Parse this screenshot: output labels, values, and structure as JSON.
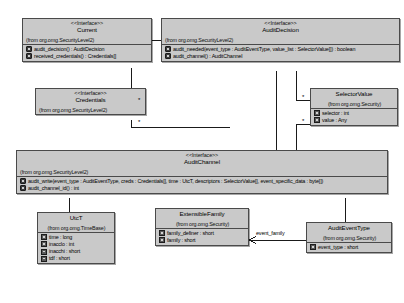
{
  "diagram": {
    "classes": [
      {
        "id": "current",
        "stereotype": "<<Interface>>",
        "name": "Current",
        "package": "(from org.omg.SecurityLevel2)",
        "members": [
          {
            "kind": "method",
            "text": "audit_decision() : AuditDecision"
          },
          {
            "kind": "method",
            "text": "received_credentials() : Credentials[]"
          }
        ]
      },
      {
        "id": "auditdecision",
        "stereotype": "<<Interface>>",
        "name": "AuditDecision",
        "package": "(from org.omg.SecurityLevel2)",
        "members": [
          {
            "kind": "method",
            "text": "audit_needed(event_type : AuditEventType, value_list : SelectorValue[]) : boolean"
          },
          {
            "kind": "method",
            "text": "audit_channel() : AuditChannel"
          }
        ]
      },
      {
        "id": "credentials",
        "stereotype": "<<Interface>>",
        "name": "Credentials",
        "package": "(from org.omg.SecurityLevel2)",
        "members": []
      },
      {
        "id": "selectorvalue",
        "stereotype": "",
        "name": "SelectorValue",
        "package": "(from org.omg.Security)",
        "members": [
          {
            "kind": "attribute",
            "text": "selector : int"
          },
          {
            "kind": "attribute",
            "text": "value : Any"
          }
        ]
      },
      {
        "id": "auditchannel",
        "stereotype": "<<Interface>>",
        "name": "AuditChannel",
        "package": "(from org.omg.SecurityLevel2)",
        "members": [
          {
            "kind": "method",
            "text": "audit_write(event_type : AuditEventType, creds : Credentials[], time : UtcT, descriptors : SelectorValue[], event_specific_data : byte[])"
          },
          {
            "kind": "method",
            "text": "audit_channel_id() : int"
          }
        ]
      },
      {
        "id": "utct",
        "stereotype": "",
        "name": "UtcT",
        "package": "(from org.omg.TimeBase)",
        "members": [
          {
            "kind": "attribute",
            "text": "time : long"
          },
          {
            "kind": "attribute",
            "text": "inacclo : int"
          },
          {
            "kind": "attribute",
            "text": "inacchi : short"
          },
          {
            "kind": "attribute",
            "text": "tdf : short"
          }
        ]
      },
      {
        "id": "extensiblefamily",
        "stereotype": "",
        "name": "ExtensibleFamily",
        "package": "(from org.omg.Security)",
        "members": [
          {
            "kind": "attribute",
            "text": "family_definer : short"
          },
          {
            "kind": "attribute",
            "text": "family : short"
          }
        ]
      },
      {
        "id": "auditeventtype",
        "stereotype": "",
        "name": "AuditEventType",
        "package": "(from org.omg.Security)",
        "members": [
          {
            "kind": "attribute",
            "text": "event_type : short"
          }
        ]
      }
    ],
    "multiplicities": [
      {
        "id": "m1",
        "text": "*"
      },
      {
        "id": "m2",
        "text": "*"
      },
      {
        "id": "m3",
        "text": "*"
      },
      {
        "id": "m4",
        "text": "*"
      }
    ],
    "association_labels": [
      {
        "id": "event_family",
        "text": "event_family"
      }
    ],
    "colors": {
      "box_fill": "#c9c9c9",
      "box_border": "#4a4a4a",
      "line": "#1a1a1a",
      "background": "#ffffff",
      "text": "#000000"
    }
  }
}
